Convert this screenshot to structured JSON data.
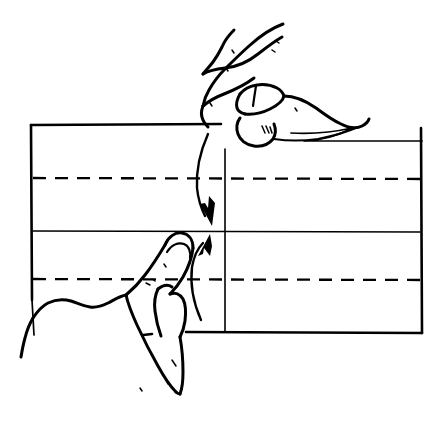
{
  "figure": {
    "title": "Paper folding step: fold top edge down to meet bottom edge",
    "domain_kind": "line-art-diagram",
    "background_color": "#ffffff",
    "ink_color": "#000000",
    "width": 446,
    "height": 423
  },
  "paper": {
    "name": "rectangular-sheet",
    "left_x": 31,
    "right_x": 422,
    "top_y": 125,
    "bottom_y": 333,
    "vertical_reference_x": 225
  },
  "creases": [
    {
      "id": "upper-dashed-crease",
      "style": "dashed",
      "y": 178,
      "meaning": "existing quarter fold line"
    },
    {
      "id": "center-solid-crease",
      "style": "solid",
      "y": 231,
      "meaning": "center horizontal fold line"
    },
    {
      "id": "lower-dashed-crease",
      "style": "dashed",
      "y": 279,
      "meaning": "existing quarter fold line"
    },
    {
      "id": "vertical-reference-crease",
      "style": "solid",
      "x": 225,
      "meaning": "vertical center crease"
    }
  ],
  "arrows": [
    {
      "id": "fold-down-arrow",
      "direction": "down",
      "label": "fold top edge downward",
      "from": {
        "x": 208,
        "y": 133
      },
      "to": {
        "x": 211,
        "y": 221
      }
    },
    {
      "id": "fold-up-arrow",
      "direction": "up",
      "label": "bring bottom edge upward",
      "from": {
        "x": 203,
        "y": 318
      },
      "to": {
        "x": 206,
        "y": 241
      }
    }
  ],
  "hands": [
    {
      "id": "upper-right-hand",
      "label": "right hand pinching the top edge of the paper",
      "position": "top-center-right"
    },
    {
      "id": "lower-left-hand",
      "label": "left hand index finger pointing up at the center crease",
      "position": "bottom-center-left"
    }
  ],
  "legend": {
    "dashed_line_meaning": "existing crease / fold line",
    "solid_line_meaning": "paper edge or current fold",
    "arrow_meaning": "direction of fold motion"
  }
}
